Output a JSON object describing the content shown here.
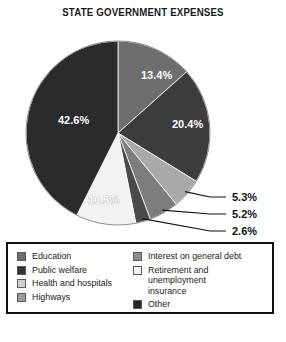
{
  "chart_data": {
    "type": "pie",
    "title": "STATE GOVERNMENT EXPENSES",
    "xlabel": "",
    "ylabel": "",
    "legend_position": "bottom",
    "grid": false,
    "categories": [
      "Education",
      "Public welfare",
      "Interest on general debt",
      "Highways",
      "Other",
      "Retirement and unemployment insurance",
      "Health and hospitals"
    ],
    "values": [
      13.4,
      20.4,
      5.3,
      5.2,
      2.6,
      10.5,
      42.6
    ],
    "labels": [
      "13.4%",
      "20.4%",
      "5.3%",
      "5.2%",
      "2.6%",
      "10.5%",
      "42.6%"
    ],
    "slice_colors": [
      "#6e6e6e",
      "#3c3c3c",
      "#a9a9a9",
      "#7d7d7d",
      "#4a4a4a",
      "#f2f2f2",
      "#2b2b2b"
    ],
    "start_angle_deg": 0,
    "direction": "clockwise",
    "units": "percent"
  },
  "title": {
    "text": "STATE GOVERNMENT EXPENSES"
  },
  "pie": {
    "inside_labels": [
      {
        "text": "13.4%",
        "x": 141,
        "y": 55
      },
      {
        "text": "20.4%",
        "x": 172,
        "y": 104
      },
      {
        "text": "42.6%",
        "x": 58,
        "y": 100
      },
      {
        "text": "10.5%",
        "x": 88,
        "y": 180
      }
    ],
    "callouts": [
      {
        "text": "5.3%",
        "x": 232,
        "y": 177
      },
      {
        "text": "5.2%",
        "x": 232,
        "y": 194
      },
      {
        "text": "2.6%",
        "x": 232,
        "y": 211
      }
    ]
  },
  "legend": {
    "left": [
      {
        "label": "Education",
        "color": "#6e6e6e"
      },
      {
        "label": "Public welfare",
        "color": "#333333"
      },
      {
        "label": "Health and hospitals",
        "color": "#cfcfcf"
      },
      {
        "label": "Highways",
        "color": "#9b9b9b"
      }
    ],
    "right": [
      {
        "label": "Interest on general debt",
        "color": "#8c8c8c"
      },
      {
        "label": "Retirement and unemployment\ninsurance",
        "color": "#f4f4f4"
      },
      {
        "label": "Other",
        "color": "#262626"
      }
    ]
  }
}
